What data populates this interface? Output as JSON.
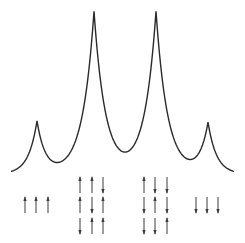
{
  "diagram": {
    "title": "",
    "colors": {
      "line": "#2a2a2a",
      "arrow": "#3a3a3a",
      "background": "#ffffff"
    },
    "spectrum": {
      "baseline_y": 174,
      "x_start": 11,
      "x_end": 234,
      "peaks": [
        {
          "x": 37,
          "top_y": 122,
          "relative_intensity": 1
        },
        {
          "x": 94,
          "top_y": 12,
          "relative_intensity": 3
        },
        {
          "x": 156,
          "top_y": 12,
          "relative_intensity": 3
        },
        {
          "x": 208,
          "top_y": 124,
          "relative_intensity": 1
        }
      ]
    },
    "spin_groups": [
      {
        "name": "all-up",
        "columns_x": [
          25,
          36,
          48
        ],
        "rows": [
          [
            "up",
            "up",
            "up"
          ]
        ],
        "row_ys": [
          205
        ]
      },
      {
        "name": "two-up-one-down",
        "columns_x": [
          80,
          92,
          103
        ],
        "rows": [
          [
            "up",
            "up",
            "down"
          ],
          [
            "up",
            "down",
            "up"
          ],
          [
            "down",
            "up",
            "up"
          ]
        ],
        "row_ys": [
          185,
          205,
          226
        ]
      },
      {
        "name": "one-up-two-down",
        "columns_x": [
          144,
          155,
          167
        ],
        "rows": [
          [
            "up",
            "down",
            "down"
          ],
          [
            "down",
            "up",
            "down"
          ],
          [
            "down",
            "down",
            "up"
          ]
        ],
        "row_ys": [
          185,
          205,
          226
        ]
      },
      {
        "name": "all-down",
        "columns_x": [
          196,
          207,
          218
        ],
        "rows": [
          [
            "down",
            "down",
            "down"
          ]
        ],
        "row_ys": [
          205
        ]
      }
    ]
  }
}
